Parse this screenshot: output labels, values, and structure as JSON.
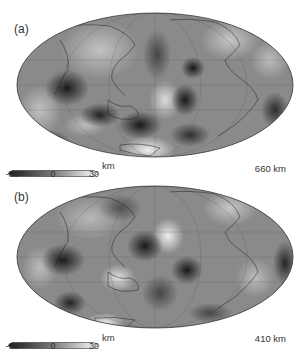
{
  "figure": {
    "panels": [
      {
        "id": "a",
        "label": "(a)",
        "depth_label": "660 km",
        "colorbar": {
          "unit": "km",
          "ticks": [
            "-30",
            "0",
            "30"
          ],
          "min": -30,
          "max": 30
        }
      },
      {
        "id": "b",
        "label": "(b)",
        "depth_label": "410 km",
        "colorbar": {
          "unit": "km",
          "ticks": [
            "-30",
            "0",
            "30"
          ],
          "min": -30,
          "max": 30
        }
      }
    ],
    "projection": "Mollweide / Hammer global map, Pacific-centered",
    "colormap": [
      "#1a1a1a",
      "#7a7a7a",
      "#ffffff"
    ]
  }
}
